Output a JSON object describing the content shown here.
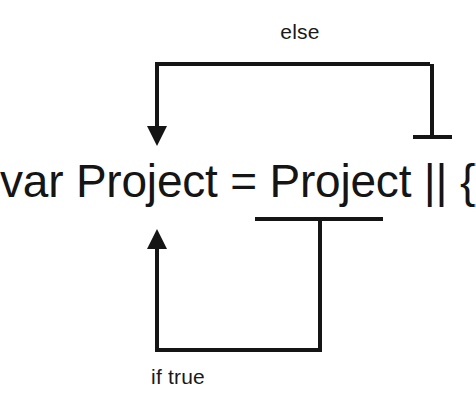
{
  "diagram": {
    "background_color": "#ffffff",
    "stroke_color": "#151515",
    "text_color": "#1a1a1a",
    "code": {
      "text": "var Project = Project || {};",
      "font_size_px": 46
    },
    "labels": {
      "else": "else",
      "if_true": "if true",
      "font_size_px": 21
    },
    "annotations": [
      {
        "name": "else-branch-arrow",
        "label": "else",
        "description": "Bracket from the right-hand literal back to the assignment target, arrowhead pointing down at the left.",
        "arrow_head": "down",
        "terminator": "bar"
      },
      {
        "name": "if-true-branch-arrow",
        "label": "if true",
        "description": "Bracket from the existing Project value back to the assignment target, arrowhead pointing up at the left.",
        "arrow_head": "up",
        "terminator": "bar"
      }
    ],
    "geometry": {
      "top_bracket": {
        "horizontal_y": 64,
        "left_x": 157,
        "right_x": 432,
        "arrow_tip_y": 143,
        "terminator_y": 137,
        "terminator_x1": 413,
        "terminator_x2": 452
      },
      "bottom_bracket": {
        "horizontal_y": 350,
        "left_x": 157,
        "right_x": 320,
        "arrow_tip_y": 232,
        "terminator_y": 219,
        "terminator_x1": 255,
        "terminator_x2": 383
      },
      "stroke_width": 4
    }
  }
}
